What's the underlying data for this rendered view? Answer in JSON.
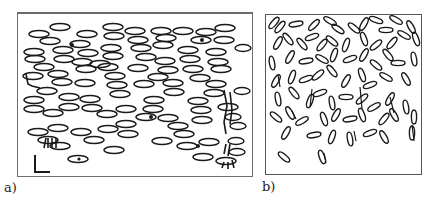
{
  "figure": {
    "panels": [
      {
        "id": "a",
        "label": "a)",
        "description": "Dense field of horizontally aligned elliptical particles with a few tangled/clustered particles near edges; L-shaped scale marker at bottom-left"
      },
      {
        "id": "b",
        "label": "b)",
        "description": "Field of randomly oriented elongated elliptical particles, denser at top, sparse at bottom"
      }
    ]
  },
  "colors": {
    "stroke": "#1a1a1a",
    "frame": "#6e6e6e",
    "background": "#ffffff"
  }
}
